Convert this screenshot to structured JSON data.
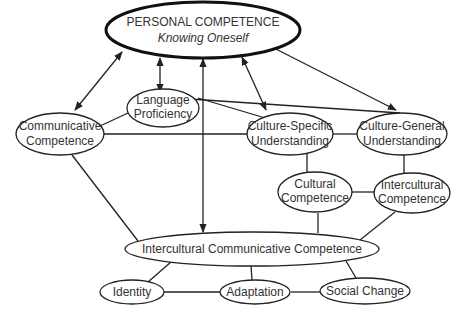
{
  "diagram": {
    "nodes": {
      "personal": {
        "line1": "PERSONAL COMPETENCE",
        "line2": "Knowing Oneself"
      },
      "language": {
        "line1": "Language",
        "line2": "Proficiency"
      },
      "communicative": {
        "line1": "Communicative",
        "line2": "Competence"
      },
      "culture_specific": {
        "line1": "Culture-Specific",
        "line2": "Understanding"
      },
      "culture_general": {
        "line1": "Culture-General",
        "line2": "Understanding"
      },
      "cultural": {
        "line1": "Cultural",
        "line2": "Competence"
      },
      "intercultural": {
        "line1": "Intercultural",
        "line2": "Competence"
      },
      "icc": {
        "line1": "Intercultural Communicative Competence"
      },
      "identity": {
        "line1": "Identity"
      },
      "adaptation": {
        "line1": "Adaptation"
      },
      "social_change": {
        "line1": "Social Change"
      }
    },
    "edges": [
      {
        "from": "personal",
        "to": "communicative",
        "type": "bidirectional-arrow"
      },
      {
        "from": "personal",
        "to": "language",
        "type": "bidirectional-arrow"
      },
      {
        "from": "personal",
        "to": "icc",
        "type": "bidirectional-arrow"
      },
      {
        "from": "personal",
        "to": "culture_specific",
        "type": "bidirectional-arrow"
      },
      {
        "from": "personal",
        "to": "culture_general",
        "type": "bidirectional-arrow"
      },
      {
        "from": "language",
        "to": "communicative",
        "type": "line"
      },
      {
        "from": "language",
        "to": "culture_specific",
        "type": "line"
      },
      {
        "from": "language",
        "to": "culture_general",
        "type": "line"
      },
      {
        "from": "communicative",
        "to": "culture_specific",
        "type": "line"
      },
      {
        "from": "culture_specific",
        "to": "culture_general",
        "type": "line"
      },
      {
        "from": "culture_specific",
        "to": "cultural",
        "type": "line"
      },
      {
        "from": "culture_general",
        "to": "intercultural",
        "type": "line"
      },
      {
        "from": "cultural",
        "to": "intercultural",
        "type": "line"
      },
      {
        "from": "cultural",
        "to": "icc",
        "type": "line"
      },
      {
        "from": "intercultural",
        "to": "icc",
        "type": "line"
      },
      {
        "from": "communicative",
        "to": "icc",
        "type": "line"
      },
      {
        "from": "icc",
        "to": "identity",
        "type": "line"
      },
      {
        "from": "icc",
        "to": "adaptation",
        "type": "line"
      },
      {
        "from": "icc",
        "to": "social_change",
        "type": "line"
      },
      {
        "from": "identity",
        "to": "adaptation",
        "type": "line"
      },
      {
        "from": "adaptation",
        "to": "social_change",
        "type": "line"
      }
    ]
  }
}
